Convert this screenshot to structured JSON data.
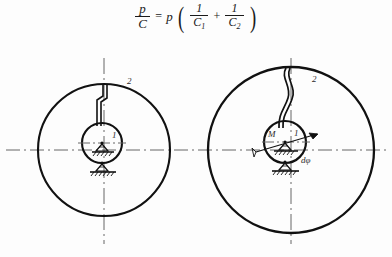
{
  "formula": {
    "lhs_num": "p",
    "lhs_den": "C",
    "equals": "=",
    "coefficient": "p",
    "open_paren": "(",
    "term1_num": "1",
    "term1_den": "C",
    "term1_sub": "1",
    "plus": "+",
    "term2_num": "1",
    "term2_den": "C",
    "term2_sub": "2",
    "close_paren": ")"
  },
  "diagram": {
    "colors": {
      "line": "#111111",
      "centerline": "#555555",
      "label": "#2b2b2b",
      "background": "#fdfdfd"
    },
    "left_assembly": {
      "name": "undeformed-configuration",
      "outer_circle_label": "2",
      "inner_circle_label": "1",
      "connector_type": "straight-stepped-rod",
      "support_upper": "pin-support-hatched",
      "support_lower": "pin-support-hatched"
    },
    "right_assembly": {
      "name": "deformed-configuration",
      "outer_circle_label": "2",
      "inner_circle_label": "1",
      "moment_label": "M",
      "rotation_label": "dφ",
      "connector_type": "buckled-curved-rod",
      "support_lower": "pin-support-hatched",
      "rotation_arrow": "arrow-up-right"
    }
  }
}
